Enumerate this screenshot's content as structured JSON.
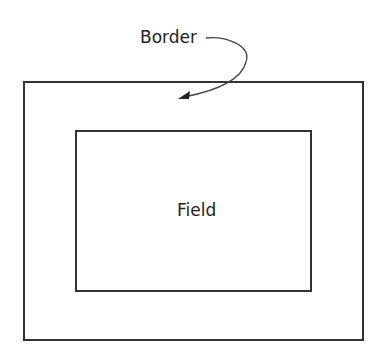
{
  "diagram": {
    "border_label": "Border",
    "field_label": "Field",
    "line_color": "#333333"
  }
}
